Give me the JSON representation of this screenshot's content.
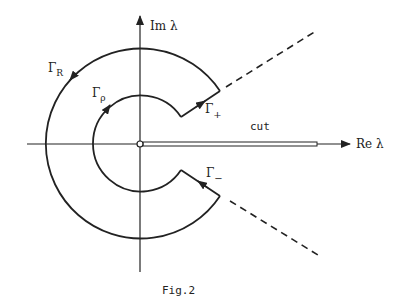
{
  "figure": {
    "caption": "Fig.2",
    "axes": {
      "x_label": "Re λ",
      "y_label": "Im λ"
    },
    "contours": {
      "outer": "Γ",
      "outer_sub": "R",
      "inner": "Γ",
      "inner_sub": "ρ",
      "upper": "Γ",
      "upper_sub": "+",
      "lower": "Γ",
      "lower_sub": "−"
    },
    "cut_label": "cut",
    "colors": {
      "ink": "#222222",
      "background": "#ffffff"
    }
  }
}
